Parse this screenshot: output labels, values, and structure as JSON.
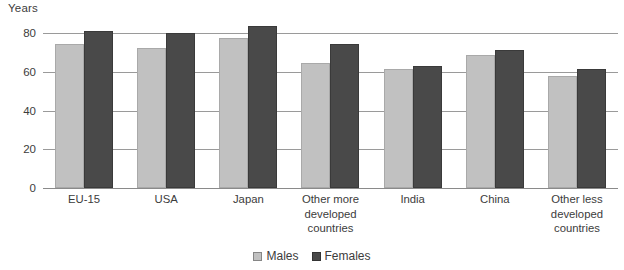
{
  "chart_data": {
    "type": "bar",
    "title": "",
    "xlabel": "",
    "ylabel": "Years",
    "ylim": [
      0,
      80
    ],
    "yticks": [
      0,
      20,
      40,
      60,
      80
    ],
    "grid": true,
    "legend_position": "bottom-center",
    "categories": [
      "EU-15",
      "USA",
      "Japan",
      "Other more developed countries",
      "India",
      "China",
      "Other less developed countries"
    ],
    "category_lines": [
      [
        "EU-15"
      ],
      [
        "USA"
      ],
      [
        "Japan"
      ],
      [
        "Other more",
        "developed",
        "countries"
      ],
      [
        "India"
      ],
      [
        "China"
      ],
      [
        "Other less",
        "developed",
        "countries"
      ]
    ],
    "series": [
      {
        "name": "Males",
        "color": "#c1c1c1",
        "values": [
          74.5,
          72.5,
          77.5,
          64.5,
          61.5,
          68.5,
          58.0
        ]
      },
      {
        "name": "Females",
        "color": "#494949",
        "values": [
          81.0,
          80.0,
          83.5,
          74.5,
          63.0,
          71.0,
          61.5
        ]
      }
    ]
  },
  "legend": {
    "items": [
      {
        "label": "Males",
        "swatch": "legend-swatch-males"
      },
      {
        "label": "Females",
        "swatch": "legend-swatch-females"
      }
    ]
  }
}
